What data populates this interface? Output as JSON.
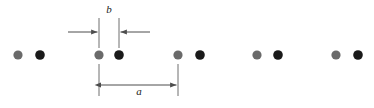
{
  "figure": {
    "name": "one-dimensional-diatomic-chain",
    "width": 374,
    "height": 108,
    "background": "#ffffff"
  },
  "colors": {
    "atom_light": "#6a6a6a",
    "atom_dark": "#1a1a1a",
    "line": "#595959",
    "label": "#222222"
  },
  "atoms": {
    "radius": 4.6,
    "baseline_y": 55,
    "unit_cell_period": 79,
    "intra_pair_spacing": 21,
    "light_positions_x": [
      18,
      99,
      178,
      257,
      336
    ],
    "dark_positions_x": [
      40,
      119,
      200,
      278,
      358
    ],
    "light_label": "light-atom",
    "dark_label": "dark-atom",
    "count_light": 5,
    "count_dark": 5
  },
  "dimension_b": {
    "label": "b",
    "label_x": 109,
    "label_y": 13,
    "extension_left_x": 99,
    "extension_right_x": 119,
    "extension_top_y": 18,
    "extension_bottom_y": 48,
    "arrow_y": 32,
    "arrow_left_start_x": 68,
    "arrow_right_start_x": 150,
    "description": "intra-cell separation between light and dark atom"
  },
  "dimension_a": {
    "label": "a",
    "label_x": 139,
    "label_y": 95,
    "extension_left_x": 99,
    "extension_right_x": 178,
    "extension_top_y": 64,
    "extension_bottom_y": 96,
    "arrow_y": 85,
    "description": "lattice constant, period of the repeating unit cell"
  }
}
